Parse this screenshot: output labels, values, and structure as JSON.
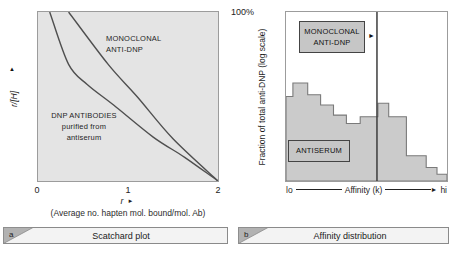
{
  "figure": {
    "panel_a": {
      "y_axis": {
        "label": "r/[H]",
        "arrow": "▲"
      },
      "x_axis": {
        "ticks": [
          "0",
          "1",
          "2"
        ],
        "label": "r",
        "arrow": "►",
        "sublabel": "(Average no. hapten mol. bound/mol. Ab)"
      },
      "monoclonal_label": {
        "line1": "MONOCLONAL",
        "line2": "ANTI-DNP"
      },
      "antiserum_label": {
        "line1": "DNP ANTIBODIES",
        "line2": "purified from",
        "line3": "antiserum"
      },
      "caption": {
        "letter": "a",
        "title": "Scatchard plot"
      }
    },
    "panel_b": {
      "top_left_label": "100%",
      "y_axis_label": "Fraction of total anti-DNP (log scale)",
      "x_axis": {
        "left": "lo",
        "label": "Affinity (k)",
        "right": "hi",
        "arrow": "►"
      },
      "monoclonal_box": {
        "line1": "MONOCLONAL",
        "line2": "ANTI-DNP"
      },
      "monoclonal_arrow": "►",
      "antiserum_box": "ANTISERUM",
      "caption": {
        "letter": "b",
        "title": "Affinity distribution"
      }
    }
  },
  "colors": {
    "plot_a_bg": "#e4e4e4",
    "plot_border": "#9c9c9c",
    "curve": "#4f4f4f",
    "histogram_fill": "#cbcbcb",
    "histogram_stroke": "#7a7a7a",
    "monoclonal_line": "#3d3d3d",
    "caption_bar_fill": "#f3f3f3",
    "caption_triangle": "#b2b2b2"
  },
  "chart_data": [
    {
      "type": "line",
      "panel": "a",
      "title": "Scatchard plot",
      "xlabel": "r (Average no. hapten mol. bound/mol. Ab)",
      "ylabel": "r/[H]",
      "xlim": [
        0,
        2
      ],
      "x_ticks": [
        0,
        1,
        2
      ],
      "y_scale": "unlabeled relative axis, 0 to 1",
      "series": [
        {
          "name": "MONOCLONAL ANTI-DNP",
          "x": [
            0.34,
            0.78,
            1.1,
            1.5,
            2.0
          ],
          "y": [
            1.0,
            0.69,
            0.5,
            0.25,
            0.0
          ]
        },
        {
          "name": "DNP ANTIBODIES purified from antiserum",
          "x": [
            0.13,
            0.34,
            0.55,
            0.84,
            1.28,
            1.63,
            2.0
          ],
          "y": [
            1.0,
            0.69,
            0.57,
            0.45,
            0.26,
            0.14,
            0.0
          ]
        }
      ]
    },
    {
      "type": "bar",
      "panel": "b",
      "title": "Affinity distribution",
      "xlabel": "Affinity (k)",
      "x_range_labels": [
        "lo",
        "hi"
      ],
      "ylabel": "Fraction of total anti-DNP (log scale)",
      "y_top_label": "100%",
      "antiserum_histogram": {
        "bar_width_frac": [
          0.043,
          0.092,
          0.08,
          0.08,
          0.08,
          0.086,
          0.11,
          0.067,
          0.11,
          0.123,
          0.067,
          0.062
        ],
        "bar_height_frac": [
          0.5,
          0.58,
          0.51,
          0.45,
          0.39,
          0.34,
          0.38,
          0.46,
          0.38,
          0.15,
          0.08,
          0.04
        ]
      },
      "monoclonal_line_x_frac": 0.565
    }
  ]
}
